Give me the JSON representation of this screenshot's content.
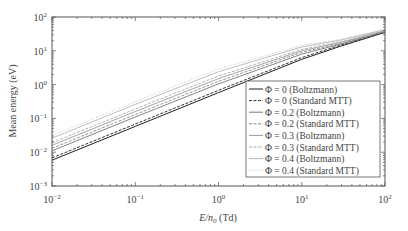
{
  "chart_data": {
    "type": "line",
    "title": "",
    "xlabel": "E/n0 (Td)",
    "ylabel": "Mean energy (eV)",
    "xscale": "log",
    "yscale": "log",
    "xlim": [
      0.01,
      100
    ],
    "ylim": [
      0.001,
      100
    ],
    "x_ticks": [
      "10^-2",
      "10^-1",
      "10^0",
      "10^1",
      "10^2"
    ],
    "y_ticks": [
      "10^-3",
      "10^-2",
      "10^-1",
      "10^0",
      "10^1",
      "10^2"
    ],
    "grid": false,
    "legend_position": "lower right",
    "x": [
      0.01,
      0.1,
      1,
      10,
      30,
      100
    ],
    "series": [
      {
        "name": "Φ = 0 (Boltzmann)",
        "style": "solid",
        "color": "#222222",
        "values": [
          0.0058,
          0.058,
          0.58,
          5.6,
          14,
          35
        ]
      },
      {
        "name": "Φ = 0 (Standard MTT)",
        "style": "dashed",
        "color": "#333333",
        "values": [
          0.0068,
          0.068,
          0.68,
          6.3,
          15,
          36
        ]
      },
      {
        "name": "Φ = 0.2 (Boltzmann)",
        "style": "solid",
        "color": "#777777",
        "values": [
          0.011,
          0.11,
          1.05,
          8.0,
          16,
          37
        ]
      },
      {
        "name": "Φ = 0.2 (Standard MTT)",
        "style": "dashed",
        "color": "#888888",
        "values": [
          0.013,
          0.13,
          1.25,
          9.0,
          17,
          38
        ]
      },
      {
        "name": "Φ = 0.3 (Boltzmann)",
        "style": "solid",
        "color": "#9a9a9a",
        "values": [
          0.016,
          0.16,
          1.5,
          10,
          18,
          39
        ]
      },
      {
        "name": "Φ = 0.3 (Standard MTT)",
        "style": "dashed",
        "color": "#aaaaaa",
        "values": [
          0.019,
          0.19,
          1.8,
          11,
          19,
          40
        ]
      },
      {
        "name": "Φ = 0.4 (Boltzmann)",
        "style": "solid",
        "color": "#b5b5b5",
        "values": [
          0.026,
          0.26,
          2.4,
          13,
          21,
          42
        ]
      },
      {
        "name": "Φ = 0.4 (Standard MTT)",
        "style": "dotted",
        "color": "#c4c4c4",
        "values": [
          0.031,
          0.31,
          2.9,
          14.5,
          22,
          44
        ]
      }
    ]
  },
  "axes": {
    "xlabel_main": "E/n",
    "xlabel_sub": "0",
    "xlabel_unit": " (Td)",
    "ylabel": "Mean energy (eV)",
    "x_tick_labels": [
      {
        "base": "10",
        "exp": "−2"
      },
      {
        "base": "10",
        "exp": "−1"
      },
      {
        "base": "10",
        "exp": "0"
      },
      {
        "base": "10",
        "exp": "1"
      },
      {
        "base": "10",
        "exp": "2"
      }
    ],
    "y_tick_labels": [
      {
        "base": "10",
        "exp": "−3"
      },
      {
        "base": "10",
        "exp": "−2"
      },
      {
        "base": "10",
        "exp": "−1"
      },
      {
        "base": "10",
        "exp": "0"
      },
      {
        "base": "10",
        "exp": "1"
      },
      {
        "base": "10",
        "exp": "2"
      }
    ]
  },
  "legend": {
    "items": [
      "Φ = 0 (Boltzmann)",
      "Φ = 0 (Standard MTT)",
      "Φ = 0.2 (Boltzmann)",
      "Φ = 0.2 (Standard MTT)",
      "Φ = 0.3 (Boltzmann)",
      "Φ = 0.3 (Standard MTT)",
      "Φ = 0.4 (Boltzmann)",
      "Φ = 0.4 (Standard MTT)"
    ]
  }
}
